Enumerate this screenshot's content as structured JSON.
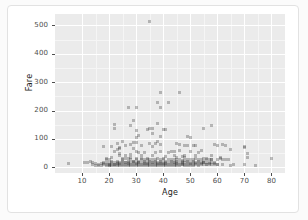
{
  "chart_data": {
    "type": "scatter",
    "title": "",
    "xlabel": "Age",
    "ylabel": "Fare",
    "xlim": [
      0,
      85
    ],
    "ylim": [
      -20,
      540
    ],
    "xticks": [
      10,
      20,
      30,
      40,
      50,
      60,
      70,
      80
    ],
    "yticks": [
      0,
      100,
      200,
      300,
      400,
      500
    ],
    "xtick_labels": [
      "10",
      "20",
      "30",
      "40",
      "50",
      "60",
      "70",
      "80"
    ],
    "ytick_labels": [
      "0",
      "100",
      "200",
      "300",
      "400",
      "500"
    ],
    "grid": true,
    "legend": "none",
    "panel_background": "#ebebeb",
    "gridline_color": "#ffffff",
    "point_color": "#3c3c3c",
    "point_opacity": 0.32,
    "series": [
      {
        "name": "passengers",
        "points": [
          [
            5,
            12
          ],
          [
            11,
            18
          ],
          [
            12,
            18
          ],
          [
            13,
            19
          ],
          [
            14,
            18
          ],
          [
            14,
            11
          ],
          [
            15,
            14
          ],
          [
            15,
            8
          ],
          [
            16,
            10
          ],
          [
            16,
            7
          ],
          [
            17,
            12
          ],
          [
            17,
            8
          ],
          [
            18,
            13
          ],
          [
            18,
            9
          ],
          [
            18,
            73
          ],
          [
            19,
            8
          ],
          [
            19,
            26
          ],
          [
            19,
            31
          ],
          [
            20,
            8
          ],
          [
            20,
            9
          ],
          [
            20,
            7
          ],
          [
            20,
            26
          ],
          [
            21,
            8
          ],
          [
            21,
            34
          ],
          [
            21,
            73
          ],
          [
            22,
            7
          ],
          [
            22,
            9
          ],
          [
            22,
            55
          ],
          [
            22,
            135
          ],
          [
            22,
            151
          ],
          [
            23,
            8
          ],
          [
            23,
            13
          ],
          [
            23,
            63
          ],
          [
            23,
            83
          ],
          [
            24,
            8
          ],
          [
            24,
            49
          ],
          [
            24,
            65
          ],
          [
            24,
            69
          ],
          [
            24,
            13
          ],
          [
            25,
            7
          ],
          [
            25,
            26
          ],
          [
            25,
            31
          ],
          [
            25,
            91
          ],
          [
            26,
            8
          ],
          [
            26,
            16
          ],
          [
            26,
            30
          ],
          [
            26,
            78
          ],
          [
            27,
            8
          ],
          [
            27,
            13
          ],
          [
            27,
            30
          ],
          [
            27,
            211
          ],
          [
            28,
            8
          ],
          [
            28,
            26
          ],
          [
            28,
            35
          ],
          [
            28,
            82
          ],
          [
            28,
            146
          ],
          [
            29,
            8
          ],
          [
            29,
            21
          ],
          [
            29,
            66
          ],
          [
            29,
            86
          ],
          [
            29,
            164
          ],
          [
            30,
            8
          ],
          [
            30,
            13
          ],
          [
            30,
            27
          ],
          [
            30,
            31
          ],
          [
            30,
            57
          ],
          [
            30,
            86
          ],
          [
            30,
            106
          ],
          [
            30,
            131
          ],
          [
            30,
            211
          ],
          [
            31,
            7
          ],
          [
            31,
            18
          ],
          [
            31,
            52
          ],
          [
            31,
            113
          ],
          [
            32,
            8
          ],
          [
            32,
            26
          ],
          [
            32,
            30
          ],
          [
            32,
            76
          ],
          [
            33,
            8
          ],
          [
            33,
            13
          ],
          [
            33,
            26
          ],
          [
            33,
            53
          ],
          [
            34,
            8
          ],
          [
            34,
            13
          ],
          [
            34,
            26
          ],
          [
            34,
            32
          ],
          [
            34,
            133
          ],
          [
            35,
            8
          ],
          [
            35,
            26
          ],
          [
            35,
            83
          ],
          [
            35,
            135
          ],
          [
            35,
            512
          ],
          [
            36,
            8
          ],
          [
            36,
            17
          ],
          [
            36,
            26
          ],
          [
            36,
            75
          ],
          [
            36,
            120
          ],
          [
            36,
            135
          ],
          [
            37,
            8
          ],
          [
            37,
            29
          ],
          [
            37,
            53
          ],
          [
            37,
            83
          ],
          [
            38,
            8
          ],
          [
            38,
            13
          ],
          [
            38,
            31
          ],
          [
            38,
            90
          ],
          [
            38,
            153
          ],
          [
            38,
            227
          ],
          [
            39,
            8
          ],
          [
            39,
            14
          ],
          [
            39,
            29
          ],
          [
            39,
            55
          ],
          [
            39,
            80
          ],
          [
            39,
            108
          ],
          [
            39,
            211
          ],
          [
            39,
            263
          ],
          [
            40,
            8
          ],
          [
            40,
            13
          ],
          [
            40,
            27
          ],
          [
            40,
            31
          ],
          [
            40,
            134
          ],
          [
            41,
            8
          ],
          [
            41,
            14
          ],
          [
            41,
            39
          ],
          [
            41,
            134
          ],
          [
            42,
            8
          ],
          [
            42,
            26
          ],
          [
            42,
            52
          ],
          [
            42,
            227
          ],
          [
            43,
            8
          ],
          [
            43,
            27
          ],
          [
            43,
            55
          ],
          [
            44,
            8
          ],
          [
            44,
            16
          ],
          [
            44,
            27
          ],
          [
            44,
            57
          ],
          [
            45,
            8
          ],
          [
            45,
            14
          ],
          [
            45,
            27
          ],
          [
            45,
            35
          ],
          [
            45,
            83
          ],
          [
            46,
            8
          ],
          [
            46,
            26
          ],
          [
            46,
            61
          ],
          [
            46,
            79
          ],
          [
            46,
            263
          ],
          [
            47,
            9
          ],
          [
            47,
            15
          ],
          [
            47,
            25
          ],
          [
            47,
            38
          ],
          [
            48,
            8
          ],
          [
            48,
            25
          ],
          [
            48,
            34
          ],
          [
            48,
            76
          ],
          [
            49,
            8
          ],
          [
            49,
            26
          ],
          [
            49,
            76
          ],
          [
            49,
            110
          ],
          [
            50,
            8
          ],
          [
            50,
            13
          ],
          [
            50,
            26
          ],
          [
            50,
            55
          ],
          [
            50,
            106
          ],
          [
            51,
            8
          ],
          [
            51,
            26
          ],
          [
            51,
            77
          ],
          [
            52,
            13
          ],
          [
            52,
            30
          ],
          [
            52,
            78
          ],
          [
            53,
            8
          ],
          [
            53,
            27
          ],
          [
            53,
            51
          ],
          [
            54,
            14
          ],
          [
            54,
            26
          ],
          [
            54,
            59
          ],
          [
            55,
            16
          ],
          [
            55,
            30
          ],
          [
            55,
            135
          ],
          [
            56,
            10
          ],
          [
            56,
            26
          ],
          [
            56,
            30
          ],
          [
            57,
            13
          ],
          [
            57,
            26
          ],
          [
            58,
            26
          ],
          [
            58,
            29
          ],
          [
            58,
            146
          ],
          [
            59,
            13
          ],
          [
            59,
            79
          ],
          [
            60,
            9
          ],
          [
            60,
            26
          ],
          [
            60,
            76
          ],
          [
            61,
            32
          ],
          [
            61,
            33
          ],
          [
            62,
            10
          ],
          [
            62,
            26
          ],
          [
            62,
            80
          ],
          [
            63,
            26
          ],
          [
            63,
            78
          ],
          [
            64,
            26
          ],
          [
            65,
            8
          ],
          [
            65,
            62
          ],
          [
            66,
            10
          ],
          [
            70,
            10
          ],
          [
            70,
            71
          ],
          [
            70,
            75
          ],
          [
            71,
            34
          ],
          [
            71,
            50
          ],
          [
            74,
            8
          ],
          [
            80,
            30
          ],
          [
            19,
            10
          ],
          [
            20,
            10
          ],
          [
            21,
            10
          ],
          [
            22,
            10
          ],
          [
            23,
            10
          ],
          [
            24,
            10
          ],
          [
            25,
            10
          ],
          [
            26,
            10
          ],
          [
            27,
            10
          ],
          [
            28,
            10
          ],
          [
            29,
            10
          ],
          [
            30,
            10
          ],
          [
            31,
            10
          ],
          [
            32,
            10
          ],
          [
            33,
            10
          ],
          [
            34,
            10
          ],
          [
            35,
            10
          ],
          [
            36,
            10
          ],
          [
            37,
            10
          ],
          [
            38,
            10
          ],
          [
            39,
            10
          ],
          [
            40,
            10
          ],
          [
            41,
            10
          ],
          [
            42,
            10
          ],
          [
            43,
            10
          ],
          [
            44,
            10
          ],
          [
            45,
            10
          ],
          [
            46,
            10
          ],
          [
            47,
            10
          ],
          [
            48,
            10
          ],
          [
            49,
            10
          ],
          [
            50,
            10
          ],
          [
            51,
            10
          ],
          [
            52,
            10
          ],
          [
            53,
            10
          ],
          [
            54,
            10
          ],
          [
            55,
            10
          ],
          [
            56,
            10
          ],
          [
            57,
            10
          ],
          [
            58,
            10
          ],
          [
            59,
            10
          ],
          [
            60,
            10
          ],
          [
            18,
            16
          ],
          [
            19,
            16
          ],
          [
            20,
            16
          ],
          [
            21,
            16
          ],
          [
            22,
            16
          ],
          [
            23,
            16
          ],
          [
            24,
            16
          ],
          [
            25,
            16
          ],
          [
            26,
            16
          ],
          [
            27,
            16
          ],
          [
            28,
            16
          ],
          [
            29,
            16
          ],
          [
            30,
            16
          ],
          [
            31,
            16
          ],
          [
            32,
            16
          ],
          [
            33,
            16
          ],
          [
            34,
            16
          ],
          [
            35,
            16
          ],
          [
            36,
            16
          ],
          [
            37,
            16
          ],
          [
            38,
            16
          ],
          [
            39,
            16
          ],
          [
            40,
            16
          ],
          [
            41,
            16
          ],
          [
            42,
            16
          ],
          [
            43,
            16
          ],
          [
            44,
            16
          ],
          [
            45,
            16
          ],
          [
            46,
            16
          ],
          [
            47,
            16
          ],
          [
            48,
            16
          ],
          [
            49,
            16
          ],
          [
            50,
            16
          ],
          [
            51,
            16
          ],
          [
            52,
            16
          ],
          [
            53,
            16
          ],
          [
            54,
            16
          ],
          [
            55,
            16
          ],
          [
            56,
            16
          ],
          [
            57,
            16
          ],
          [
            58,
            16
          ],
          [
            59,
            16
          ],
          [
            21,
            22
          ],
          [
            23,
            22
          ],
          [
            25,
            22
          ],
          [
            27,
            22
          ],
          [
            29,
            22
          ],
          [
            31,
            22
          ],
          [
            33,
            22
          ],
          [
            35,
            22
          ],
          [
            37,
            22
          ],
          [
            39,
            22
          ],
          [
            41,
            22
          ],
          [
            43,
            22
          ],
          [
            45,
            22
          ],
          [
            47,
            22
          ],
          [
            49,
            22
          ],
          [
            51,
            22
          ],
          [
            53,
            22
          ],
          [
            55,
            22
          ],
          [
            24,
            40
          ],
          [
            26,
            42
          ],
          [
            28,
            44
          ],
          [
            32,
            41
          ],
          [
            36,
            40
          ],
          [
            44,
            41
          ],
          [
            48,
            42
          ],
          [
            52,
            40
          ],
          [
            58,
            41
          ]
        ]
      }
    ]
  }
}
